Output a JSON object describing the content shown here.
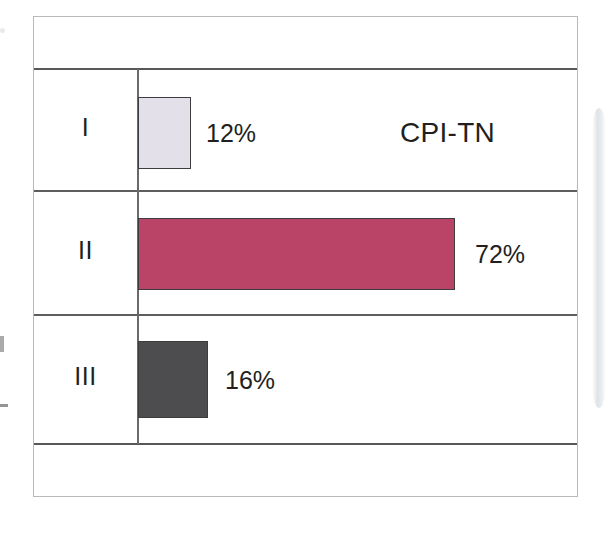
{
  "figure": {
    "series_label": "CPI-TN",
    "frame_border_color": "#b9b9bb",
    "rule_color": "#58585a",
    "axis_color": "#6a6a6c",
    "text_color": "#231f20"
  },
  "chart_data": {
    "type": "bar",
    "orientation": "horizontal",
    "title": "CPI-TN",
    "xlabel": "",
    "ylabel": "",
    "categories": [
      "I",
      "II",
      "III"
    ],
    "values": [
      12,
      72,
      16
    ],
    "value_labels": [
      "12%",
      "72%",
      "16%"
    ],
    "value_unit": "%",
    "xlim": [
      0,
      100
    ],
    "grid": false,
    "legend": false,
    "legend_position": "none",
    "bar_colors": [
      "#e4e0ea",
      "#b94468",
      "#4d4d4f"
    ],
    "bar_border_color": "#3d3d3f",
    "series": [
      {
        "name": "CPI-TN",
        "values": [
          12,
          72,
          16
        ]
      }
    ],
    "points": [
      {
        "category": "I",
        "value": 12,
        "label": "12%",
        "color": "#e4e0ea"
      },
      {
        "category": "II",
        "value": 72,
        "label": "72%",
        "color": "#b94468"
      },
      {
        "category": "III",
        "value": 16,
        "label": "16%",
        "color": "#4d4d4f"
      }
    ]
  },
  "rows": [
    {
      "label": "I",
      "value_label": "12%"
    },
    {
      "label": "II",
      "value_label": "72%"
    },
    {
      "label": "III",
      "value_label": "16%"
    }
  ]
}
